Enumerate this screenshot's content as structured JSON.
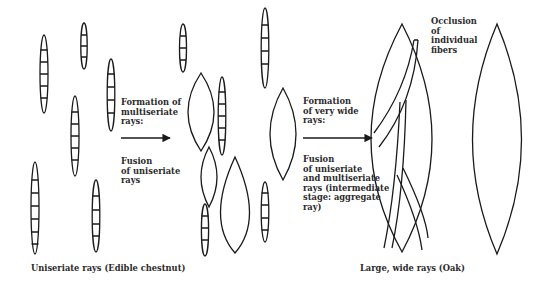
{
  "diagram": {
    "stages": [
      {
        "id": "uniseriate",
        "caption": "Uniseriate rays (Edible chestnut)"
      },
      {
        "id": "multiseriate",
        "caption": ""
      },
      {
        "id": "large-wide",
        "caption": "Large, wide rays (Oak)"
      }
    ],
    "transitions": [
      {
        "from": "uniseriate",
        "to": "multiseriate",
        "above": [
          "Formation of",
          "multiseriate",
          "rays:"
        ],
        "below": [
          "Fusion",
          "of uniseriate",
          "rays"
        ]
      },
      {
        "from": "multiseriate",
        "to": "large-wide",
        "above": [
          "Formation",
          "of very wide",
          "rays:"
        ],
        "below": [
          "Fusion",
          "of uniseriate",
          "and multiseriate",
          "rays (intermediate",
          "stage: aggregate",
          "ray)"
        ]
      }
    ],
    "annotations": [
      {
        "target": "aggregate-ray",
        "lines": [
          "Occlusion",
          "of",
          "individual",
          "fibers"
        ]
      }
    ],
    "colors": {
      "stroke": "#1a1a1a",
      "text": "#2a2a2a",
      "background": "#ffffff"
    }
  }
}
